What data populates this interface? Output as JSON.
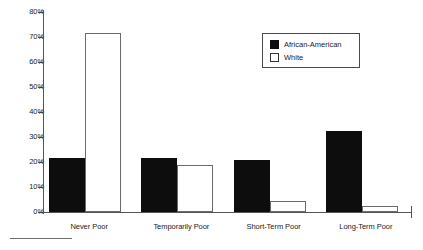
{
  "chart_data": {
    "type": "bar",
    "title": "",
    "xlabel": "",
    "ylabel": "",
    "ylim": [
      0,
      80
    ],
    "ytick_labels": [
      "0%",
      "10%",
      "20%",
      "30%",
      "40%",
      "50%",
      "60%",
      "70%",
      "80%"
    ],
    "ytick_values": [
      0,
      10,
      20,
      30,
      40,
      50,
      60,
      70,
      80
    ],
    "grid": false,
    "legend_position": "upper-right",
    "categories": [
      "Never Poor",
      "Temporarily Poor",
      "Short-Term Poor",
      "Long-Term Poor"
    ],
    "series": [
      {
        "name": "African-American",
        "color": "#0d0d0d",
        "values": [
          21.5,
          21.5,
          21,
          32.5
        ]
      },
      {
        "name": "White",
        "color": "#ffffff",
        "values": [
          71.5,
          19,
          4.5,
          2.5
        ]
      }
    ]
  },
  "legend": {
    "entries": [
      {
        "label": "African-American",
        "swatch": "black"
      },
      {
        "label": "White",
        "swatch": "white"
      }
    ]
  },
  "colors": {
    "african_american": "#0d0d0d",
    "white_bar_fill": "#ffffff",
    "white_bar_stroke": "#6b6b6b",
    "axis": "#555555",
    "text": "#1a1a1a"
  }
}
